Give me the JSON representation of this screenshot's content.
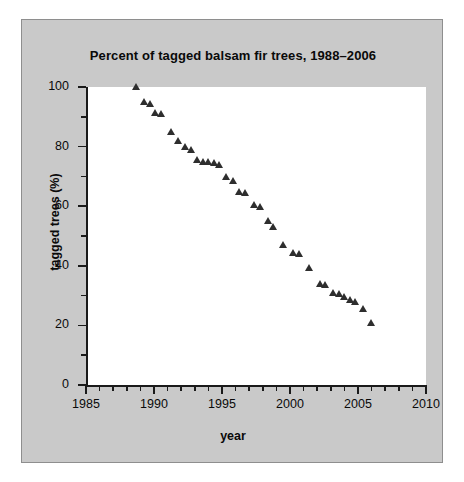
{
  "figure": {
    "background_color": "#c9c9c9",
    "plot_background_color": "#ffffff",
    "marker_color": "#2e2e2e",
    "axis_color": "#1a1a1a"
  },
  "chart_data": {
    "type": "scatter",
    "title": "Percent of tagged balsam fir trees, 1988–2006",
    "xlabel": "year",
    "ylabel": "tagged trees (%)",
    "xlim": [
      1985,
      2010
    ],
    "ylim": [
      0,
      100
    ],
    "x_major_ticks": [
      1985,
      1990,
      1995,
      2000,
      2005,
      2010
    ],
    "x_tick_labels": [
      "1985",
      "1990",
      "1995",
      "2000",
      "2005",
      "2010"
    ],
    "x_minor_tick_interval": 1,
    "y_major_ticks": [
      0,
      20,
      40,
      60,
      80,
      100
    ],
    "y_tick_labels": [
      "0",
      "20",
      "40",
      "60",
      "80",
      "100"
    ],
    "y_minor_tick_interval": 10,
    "grid": false,
    "legend": false,
    "marker_shape": "triangle",
    "series": [
      {
        "name": "tagged trees",
        "points": [
          [
            1988.7,
            100.0
          ],
          [
            1989.3,
            95.0
          ],
          [
            1989.7,
            94.5
          ],
          [
            1990.1,
            91.5
          ],
          [
            1990.5,
            91.0
          ],
          [
            1991.3,
            85.0
          ],
          [
            1991.8,
            82.0
          ],
          [
            1992.3,
            80.0
          ],
          [
            1992.7,
            79.0
          ],
          [
            1993.2,
            75.5
          ],
          [
            1993.6,
            75.0
          ],
          [
            1994.0,
            75.0
          ],
          [
            1994.4,
            74.5
          ],
          [
            1994.8,
            74.0
          ],
          [
            1995.3,
            70.0
          ],
          [
            1995.8,
            68.5
          ],
          [
            1996.3,
            65.0
          ],
          [
            1996.7,
            64.5
          ],
          [
            1997.4,
            60.5
          ],
          [
            1997.8,
            60.0
          ],
          [
            1998.4,
            55.0
          ],
          [
            1998.8,
            53.0
          ],
          [
            1999.5,
            47.0
          ],
          [
            2000.2,
            44.5
          ],
          [
            2000.7,
            44.0
          ],
          [
            2001.4,
            39.5
          ],
          [
            2002.2,
            34.0
          ],
          [
            2002.6,
            33.5
          ],
          [
            2003.2,
            31.0
          ],
          [
            2003.6,
            30.5
          ],
          [
            2004.0,
            29.5
          ],
          [
            2004.4,
            28.5
          ],
          [
            2004.8,
            28.0
          ],
          [
            2005.4,
            25.5
          ],
          [
            2006.0,
            21.0
          ]
        ]
      }
    ]
  }
}
